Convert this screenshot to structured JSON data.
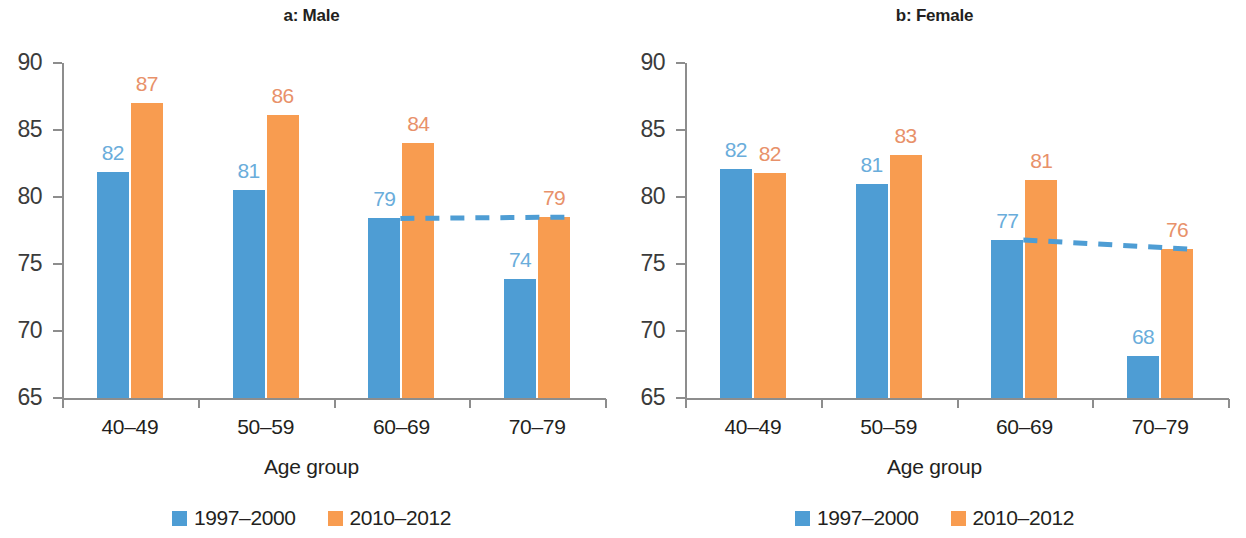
{
  "figure": {
    "panels": [
      {
        "title": "a: Male",
        "xlabel": "Age group",
        "legend": [
          {
            "label": "1997–2000",
            "color": "#4e9dd4"
          },
          {
            "label": "2010–2012",
            "color": "#f89c50"
          }
        ]
      },
      {
        "title": "b: Female",
        "xlabel": "Age group",
        "legend": [
          {
            "label": "1997–2000",
            "color": "#4e9dd4"
          },
          {
            "label": "2010–2012",
            "color": "#f89c50"
          }
        ]
      }
    ]
  },
  "chart_data": [
    {
      "type": "bar",
      "title": "a: Male",
      "xlabel": "Age group",
      "ylabel": "",
      "categories": [
        "40–49",
        "50–59",
        "60–69",
        "70–79"
      ],
      "ylim": [
        65,
        90
      ],
      "yticks": [
        65,
        70,
        75,
        80,
        85,
        90
      ],
      "grid": false,
      "legend_position": "bottom",
      "series": [
        {
          "name": "1997–2000",
          "color": "#4e9dd4",
          "values": [
            81.9,
            80.5,
            78.4,
            73.9
          ],
          "labels": [
            "82",
            "81",
            "79",
            "74"
          ]
        },
        {
          "name": "2010–2012",
          "color": "#f89c50",
          "values": [
            87.0,
            86.1,
            84.0,
            78.5
          ],
          "labels": [
            "87",
            "86",
            "84",
            "79"
          ]
        }
      ],
      "annotations": [
        {
          "type": "dashed-line",
          "color": "#4e9dd4",
          "from": {
            "category": "60–69",
            "value": 78.4
          },
          "to": {
            "category": "70–79",
            "value": 78.5
          }
        }
      ]
    },
    {
      "type": "bar",
      "title": "b: Female",
      "xlabel": "Age group",
      "ylabel": "",
      "categories": [
        "40–49",
        "50–59",
        "60–69",
        "70–79"
      ],
      "ylim": [
        65,
        90
      ],
      "yticks": [
        65,
        70,
        75,
        80,
        85,
        90
      ],
      "grid": false,
      "legend_position": "bottom",
      "series": [
        {
          "name": "1997–2000",
          "color": "#4e9dd4",
          "values": [
            82.1,
            81.0,
            76.8,
            68.1
          ],
          "labels": [
            "82",
            "81",
            "77",
            "68"
          ]
        },
        {
          "name": "2010–2012",
          "color": "#f89c50",
          "values": [
            81.8,
            83.1,
            81.3,
            76.1
          ],
          "labels": [
            "82",
            "83",
            "81",
            "76"
          ]
        }
      ],
      "annotations": [
        {
          "type": "dashed-line",
          "color": "#4e9dd4",
          "from": {
            "category": "60–69",
            "value": 76.8
          },
          "to": {
            "category": "70–79",
            "value": 76.1
          }
        }
      ]
    }
  ]
}
